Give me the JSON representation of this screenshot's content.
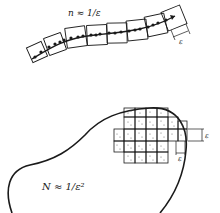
{
  "figure": {
    "top": {
      "label": "n ≈ 1/ε",
      "epsilon_label": "ε",
      "description": "curve covered by a chain of ε-sized boxes",
      "box_count": 8
    },
    "bottom": {
      "label": "N ≈ 1/ε²",
      "epsilon_label_horizontal": "ε",
      "epsilon_label_vertical": "ε",
      "description": "region covered by a grid of ε-sized squares"
    }
  },
  "colors": {
    "ink": "#1a1a1a",
    "background": "#ffffff"
  }
}
